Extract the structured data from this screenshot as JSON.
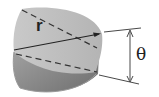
{
  "diagram": {
    "labels": {
      "radius": "r",
      "angle": "θ"
    },
    "colors": {
      "top_face": "#bdbdbd",
      "side_face": "#8a8a8a",
      "lines": "#333333"
    }
  }
}
